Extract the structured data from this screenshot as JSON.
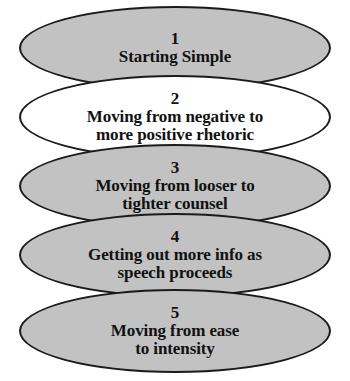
{
  "diagram": {
    "type": "stacked-ellipse-progression",
    "background_color": "#ffffff",
    "stroke_color": "#1b1b1b",
    "gray_fill": "#c2c2c2",
    "white_fill": "#ffffff",
    "stages": [
      {
        "number": "1",
        "label": "Starting Simple",
        "fill": "gray"
      },
      {
        "number": "2",
        "label": "Moving from negative to\nmore positive rhetoric",
        "fill": "white"
      },
      {
        "number": "3",
        "label": "Moving from looser to\ntighter counsel",
        "fill": "gray"
      },
      {
        "number": "4",
        "label": "Getting out more info as\nspeech proceeds",
        "fill": "gray"
      },
      {
        "number": "5",
        "label": "Moving from ease\nto intensity",
        "fill": "gray"
      }
    ]
  }
}
